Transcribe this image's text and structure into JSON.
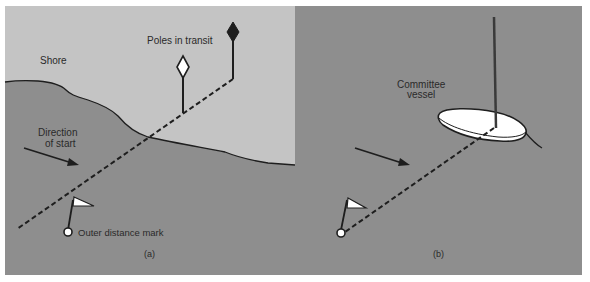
{
  "figure": {
    "colors": {
      "sea": "#8e8e8e",
      "shore": "#c4c4c4",
      "line": "#1e1e1e",
      "mark_fill": "#ffffff",
      "background": "#ffffff"
    },
    "panel_a": {
      "caption": "(a)",
      "labels": {
        "shore": "Shore",
        "poles": "Poles in transit",
        "direction_line1": "Direction",
        "direction_line2": "of start",
        "outer_mark": "Outer distance mark"
      }
    },
    "panel_b": {
      "caption": "(b)",
      "labels": {
        "vessel_line1": "Committee",
        "vessel_line2": "vessel"
      }
    }
  }
}
